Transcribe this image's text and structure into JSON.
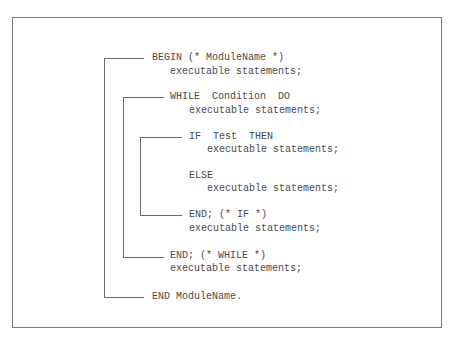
{
  "diagram": {
    "colors": {
      "frame": "#7a7a7a",
      "bracket": "#6a6a6a",
      "text": "#4a4a4a"
    },
    "code": {
      "lines": [
        {
          "text": "BEGIN (* ModuleName *)",
          "level": 0
        },
        {
          "text": "executable statements;",
          "level": 1
        },
        {
          "text": "WHILE  Condition  DO",
          "level": 1
        },
        {
          "text": "executable statements;",
          "level": 2
        },
        {
          "text": "IF  Test  THEN",
          "level": 2
        },
        {
          "text": "executable statements;",
          "level": 3
        },
        {
          "text": "ELSE",
          "level": 2
        },
        {
          "text": "executable statements;",
          "level": 3
        },
        {
          "text": "END; (* IF *)",
          "level": 2
        },
        {
          "text": "executable statements;",
          "level": 2
        },
        {
          "text": "END; (* WHILE *)",
          "level": 1
        },
        {
          "text": "executable statements;",
          "level": 1
        },
        {
          "text": "END ModuleName.",
          "level": 0
        }
      ]
    },
    "brackets": [
      {
        "name": "module-block",
        "opens": "BEGIN",
        "closes": "END ModuleName."
      },
      {
        "name": "while-block",
        "opens": "WHILE",
        "closes": "END; (* WHILE *)"
      },
      {
        "name": "if-block",
        "opens": "IF",
        "closes": "END; (* IF *)"
      }
    ]
  }
}
